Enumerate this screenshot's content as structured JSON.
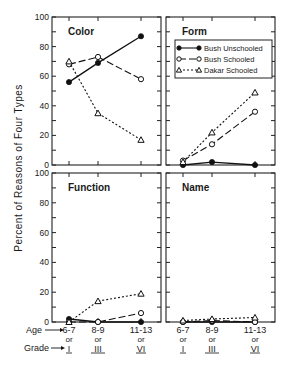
{
  "chart_data": {
    "type": "line",
    "ylabel": "Percent of Reasons of Four Types",
    "ylim": [
      0,
      100
    ],
    "yticks": [
      0,
      20,
      40,
      60,
      80,
      100
    ],
    "x_axis_prefixes": {
      "age": "Age",
      "grade": "Grade"
    },
    "categories": [
      {
        "age": "6-7",
        "or": "or",
        "grade": "I"
      },
      {
        "age": "8-9",
        "or": "or",
        "grade": "III"
      },
      {
        "age": "11-13",
        "or": "or",
        "grade": "VI"
      }
    ],
    "legend": [
      {
        "name": "Bush Unschooled",
        "marker": "filled-circle",
        "line": "solid"
      },
      {
        "name": "Bush Schooled",
        "marker": "open-circle",
        "line": "dashed"
      },
      {
        "name": "Dakar Schooled",
        "marker": "open-triangle",
        "line": "dotted"
      }
    ],
    "legend_position": "Form panel, upper area",
    "panels": [
      {
        "title": "Color",
        "series": [
          {
            "name": "Bush Unschooled",
            "values": [
              56,
              69,
              87
            ]
          },
          {
            "name": "Bush Schooled",
            "values": [
              68,
              73,
              58
            ]
          },
          {
            "name": "Dakar Schooled",
            "values": [
              70,
              35,
              17
            ]
          }
        ]
      },
      {
        "title": "Form",
        "series": [
          {
            "name": "Bush Unschooled",
            "values": [
              0,
              2,
              0
            ]
          },
          {
            "name": "Bush Schooled",
            "values": [
              3,
              14,
              36
            ]
          },
          {
            "name": "Dakar Schooled",
            "values": [
              2,
              22,
              49
            ]
          }
        ]
      },
      {
        "title": "Function",
        "series": [
          {
            "name": "Bush Unschooled",
            "values": [
              2,
              0,
              0
            ]
          },
          {
            "name": "Bush Schooled",
            "values": [
              0,
              0,
              6
            ]
          },
          {
            "name": "Dakar Schooled",
            "values": [
              0,
              14,
              19
            ]
          }
        ]
      },
      {
        "title": "Name",
        "series": [
          {
            "name": "Bush Unschooled",
            "values": [
              0,
              0,
              0
            ]
          },
          {
            "name": "Bush Schooled",
            "values": [
              0,
              1,
              0
            ]
          },
          {
            "name": "Dakar Schooled",
            "values": [
              1,
              2,
              3
            ]
          }
        ]
      }
    ],
    "grid": false
  }
}
